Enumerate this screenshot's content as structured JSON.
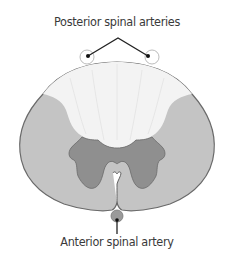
{
  "diagram": {
    "labels": {
      "posterior": "Posterior spinal arteries",
      "anterior": "Anterior spinal artery"
    },
    "colors": {
      "white_matter_lateral": "#c4c4c4",
      "posterior_columns": "#f3f3f3",
      "gray_matter": "#8f8f8f",
      "outline": "#6a6a6a",
      "anterior_artery": "#9a9a9a",
      "leader_line": "#222222",
      "text": "#3a3a3a"
    }
  }
}
